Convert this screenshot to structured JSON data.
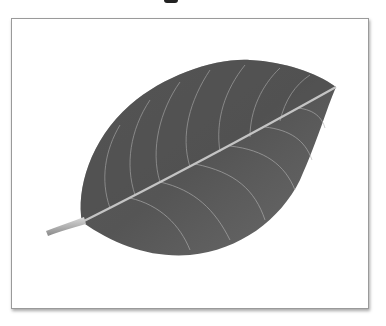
{
  "image": {
    "subject": "leaf",
    "description": "Grayscale photograph of a single leaf with visible veins, framed with a thin gray border and drop shadow",
    "colors": {
      "background": "#ffffff",
      "frame_border": "#9a9a9a",
      "leaf_dark": "#4a4a4a",
      "leaf_mid": "#6e6e6e",
      "vein": "#b4b4b4"
    }
  }
}
